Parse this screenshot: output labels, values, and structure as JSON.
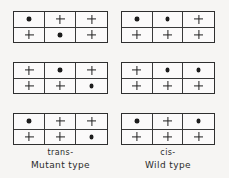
{
  "figure": {
    "background_color": "#f6f5f3",
    "line_color": "#2f2f2f",
    "mark_symbols": {
      "dot": "mutation-dot",
      "plus": "wild-type-plus"
    }
  },
  "columns": [
    {
      "id": "left",
      "caption_config": "trans-",
      "caption_type": "Mutant type",
      "grids": [
        {
          "id": "left-grid-1",
          "rows": [
            [
              "dot",
              "plus",
              "plus"
            ],
            [
              "plus",
              "dot",
              "plus"
            ]
          ]
        },
        {
          "id": "left-grid-2",
          "rows": [
            [
              "plus",
              "dot",
              "plus"
            ],
            [
              "plus",
              "plus",
              "dot"
            ]
          ]
        },
        {
          "id": "left-grid-3",
          "rows": [
            [
              "dot",
              "plus",
              "plus"
            ],
            [
              "plus",
              "plus",
              "dot"
            ]
          ]
        }
      ]
    },
    {
      "id": "right",
      "caption_config": "cis-",
      "caption_type": "Wild type",
      "grids": [
        {
          "id": "right-grid-1",
          "rows": [
            [
              "dot",
              "dot",
              "plus"
            ],
            [
              "plus",
              "plus",
              "plus"
            ]
          ]
        },
        {
          "id": "right-grid-2",
          "rows": [
            [
              "plus",
              "dot",
              "dot"
            ],
            [
              "plus",
              "plus",
              "plus"
            ]
          ]
        },
        {
          "id": "right-grid-3",
          "rows": [
            [
              "dot",
              "plus",
              "dot"
            ],
            [
              "plus",
              "plus",
              "plus"
            ]
          ]
        }
      ]
    }
  ]
}
